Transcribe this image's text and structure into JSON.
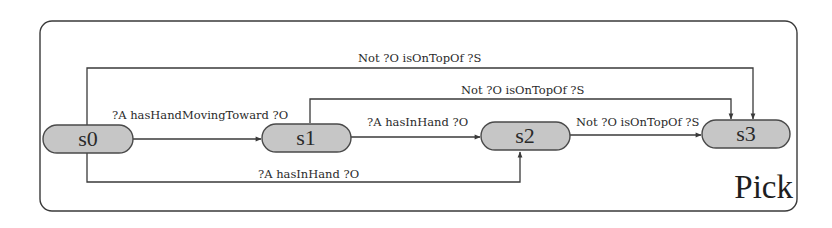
{
  "diagram": {
    "title": "Pick",
    "colors": {
      "node_fill": "#c6c6c6",
      "node_stroke": "#4a4a4a",
      "edge": "#3a3a3a",
      "text": "#2a2a2a"
    },
    "states": [
      {
        "id": "s0",
        "label": "s0"
      },
      {
        "id": "s1",
        "label": "s1"
      },
      {
        "id": "s2",
        "label": "s2"
      },
      {
        "id": "s3",
        "label": "s3"
      }
    ],
    "transitions": [
      {
        "from": "s0",
        "to": "s1",
        "label": "?A hasHandMovingToward ?O"
      },
      {
        "from": "s1",
        "to": "s2",
        "label": "?A hasInHand ?O"
      },
      {
        "from": "s2",
        "to": "s3",
        "label": "Not ?O isOnTopOf ?S"
      },
      {
        "from": "s0",
        "to": "s3",
        "label": "Not ?O isOnTopOf ?S"
      },
      {
        "from": "s1",
        "to": "s3",
        "label": "Not ?O isOnTopOf ?S"
      },
      {
        "from": "s0",
        "to": "s2",
        "label": "?A hasInHand ?O"
      }
    ]
  }
}
